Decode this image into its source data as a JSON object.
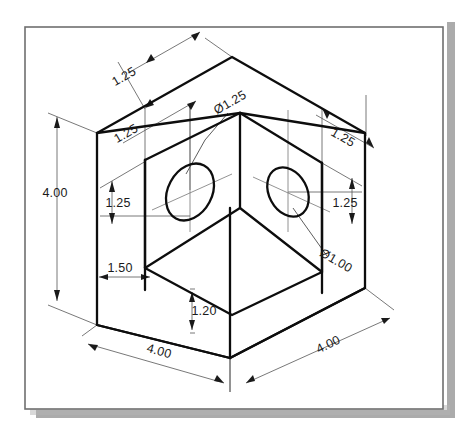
{
  "document": {
    "type": "isometric-technical-drawing",
    "title": "Isometric box with two through holes",
    "page": {
      "background_color": "#ffffff",
      "sheet_color": "#ffffff",
      "border_color": "#6b6b6b",
      "shadow_color": "#9a9a9a",
      "line_color": "#1a1a1a",
      "thin_line_color": "#666666"
    }
  },
  "drawing": {
    "object_name": "open-box-part",
    "units": "inches",
    "line_weight_visible": 2.2,
    "line_weight_dimension": 0.8
  },
  "dimensions": [
    {
      "id": "top-left-depth",
      "label": "1.25",
      "name": "dimension-top-left-125",
      "x": 126,
      "y": 80,
      "rotate": -30
    },
    {
      "id": "top-left-wall",
      "label": "1.25",
      "name": "dimension-top-wall-125",
      "x": 128,
      "y": 137,
      "rotate": -30
    },
    {
      "id": "hole-left-diameter",
      "label": "Ø1.25",
      "name": "dimension-hole-left-d125",
      "x": 232,
      "y": 106,
      "rotate": -30
    },
    {
      "id": "top-right-wall",
      "label": "1.25",
      "name": "dimension-top-right-125",
      "x": 341,
      "y": 141,
      "rotate": 30
    },
    {
      "id": "left-hole-height",
      "label": "1.25",
      "name": "dimension-left-hole-125",
      "x": 118,
      "y": 203,
      "rotate": 0
    },
    {
      "id": "right-hole-height",
      "label": "1.25",
      "name": "dimension-right-hole-125",
      "x": 345,
      "y": 203,
      "rotate": 0
    },
    {
      "id": "hole-right-diameter",
      "label": "Ø1.00",
      "name": "dimension-hole-right-d100",
      "x": 332,
      "y": 262,
      "rotate": 30
    },
    {
      "id": "overall-height",
      "label": "4.00",
      "name": "dimension-overall-height",
      "x": 55,
      "y": 193,
      "rotate": 0
    },
    {
      "id": "wall-thickness",
      "label": "1.50",
      "name": "dimension-wall-thickness",
      "x": 112,
      "y": 279,
      "rotate": 0
    },
    {
      "id": "floor-thickness",
      "label": "1.20",
      "name": "dimension-floor-thickness",
      "x": 200,
      "y": 319,
      "rotate": 0
    },
    {
      "id": "overall-width",
      "label": "4.00",
      "name": "dimension-overall-width",
      "x": 158,
      "y": 352,
      "rotate": 30
    },
    {
      "id": "overall-depth",
      "label": "4.00",
      "name": "dimension-overall-depth",
      "x": 330,
      "y": 345,
      "rotate": -30
    }
  ],
  "features": {
    "hole_left": {
      "name": "hole-left",
      "diameter_label": "Ø1.25"
    },
    "hole_right": {
      "name": "hole-right",
      "diameter_label": "Ø1.00"
    }
  }
}
